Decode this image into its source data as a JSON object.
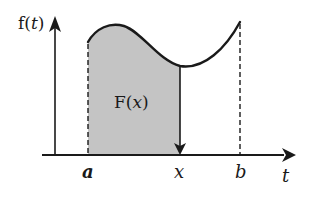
{
  "diagram": {
    "y_axis_label_func": "f",
    "y_axis_label_open": "(",
    "y_axis_label_var": "t",
    "y_axis_label_close": ")",
    "x_axis_label": "t",
    "region_label_func": "F",
    "region_label_open": "(",
    "region_label_var": "x",
    "region_label_close": ")",
    "tick_a": "a",
    "tick_x": "x",
    "tick_b": "b",
    "colors": {
      "line": "#1a1a1a",
      "fill": "#c4c4c4",
      "background": "#ffffff"
    }
  }
}
